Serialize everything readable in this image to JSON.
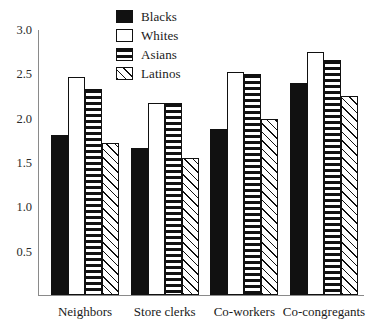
{
  "chart_data": {
    "type": "bar",
    "title": "",
    "subtitle": "",
    "xlabel": "",
    "ylabel": "",
    "ylim": [
      0,
      3.0
    ],
    "yticks": [
      "3.0",
      "2.5",
      "2.0",
      "1.5",
      "1.0",
      "0.5"
    ],
    "ytick_values": [
      3.0,
      2.5,
      2.0,
      1.5,
      1.0,
      0.5
    ],
    "grid": false,
    "legend_position": "top-center",
    "categories": [
      "Neighbors",
      "Store clerks",
      "Co-workers",
      "Co-congregants"
    ],
    "series": [
      {
        "name": "Blacks",
        "pattern": "solid-black",
        "values": [
          1.81,
          1.66,
          1.87,
          2.39
        ]
      },
      {
        "name": "Whites",
        "pattern": "open-white",
        "values": [
          2.46,
          2.16,
          2.51,
          2.74
        ]
      },
      {
        "name": "Asians",
        "pattern": "horizontal-stripes",
        "values": [
          2.32,
          2.17,
          2.49,
          2.65
        ]
      },
      {
        "name": "Latinos",
        "pattern": "diagonal-hatch",
        "values": [
          1.71,
          1.55,
          1.99,
          2.25
        ]
      }
    ]
  },
  "legend": {
    "items": [
      {
        "label": "Blacks",
        "swatch": "solid-black"
      },
      {
        "label": "Whites",
        "swatch": "open-white"
      },
      {
        "label": "Asians",
        "swatch": "horizontal-stripes"
      },
      {
        "label": "Latinos",
        "swatch": "diagonal-hatch"
      }
    ]
  },
  "colors": {
    "ink": "#111111",
    "axis": "#8a8a8a",
    "background": "#ffffff"
  }
}
